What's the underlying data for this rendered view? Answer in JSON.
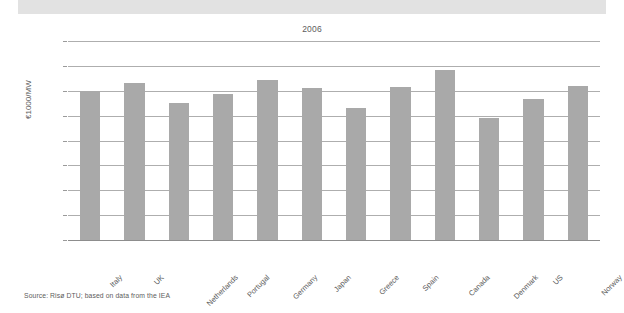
{
  "page": {
    "source_note": "Source: Risø DTU; based on data from the IEA"
  },
  "chart_data": {
    "type": "bar",
    "title": "2006",
    "xlabel": "",
    "ylabel": "€1000/MW",
    "ylim": [
      0,
      1600
    ],
    "yticks": [
      0,
      200,
      400,
      600,
      800,
      1000,
      1200,
      1400,
      1600
    ],
    "ytick_labels": [
      "0",
      "200",
      "400",
      "600",
      "800",
      "1000",
      "1200",
      "1400",
      "1600"
    ],
    "grid": true,
    "legend": null,
    "bar_color": "#a9a9a9",
    "categories": [
      "Italy",
      "UK",
      "Netherlands",
      "Portugal",
      "Germany",
      "Japan",
      "Greece",
      "Spain",
      "Canada",
      "Denmark",
      "US",
      "Norway"
    ],
    "values": [
      1200,
      1265,
      1100,
      1175,
      1290,
      1220,
      1060,
      1230,
      1365,
      980,
      1135,
      1235
    ]
  }
}
